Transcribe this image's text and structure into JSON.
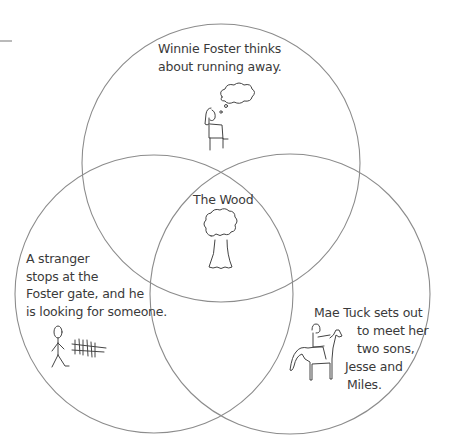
{
  "diagram": {
    "type": "venn",
    "stroke_color": "#8c8c8c",
    "circles": [
      {
        "id": "top",
        "cx": 221,
        "cy": 163,
        "r": 139
      },
      {
        "id": "left",
        "cx": 154,
        "cy": 294,
        "r": 139
      },
      {
        "id": "right",
        "cx": 290,
        "cy": 294,
        "r": 140
      }
    ],
    "regions": {
      "top": {
        "lines": [
          "Winnie Foster thinks",
          "about running away."
        ],
        "icon": "girl-sitting-thinking-icon"
      },
      "center": {
        "lines": [
          "The Wood"
        ],
        "icon": "tree-icon"
      },
      "left": {
        "lines": [
          "A stranger",
          "stops at the",
          "Foster gate, and he",
          "is looking for someone."
        ],
        "icon": "stick-figure-at-gate-icon"
      },
      "right": {
        "lines": [
          "Mae Tuck sets out",
          "to meet her",
          "two sons,",
          "Jesse and",
          "Miles."
        ],
        "icon": "woman-on-horse-icon"
      }
    }
  }
}
